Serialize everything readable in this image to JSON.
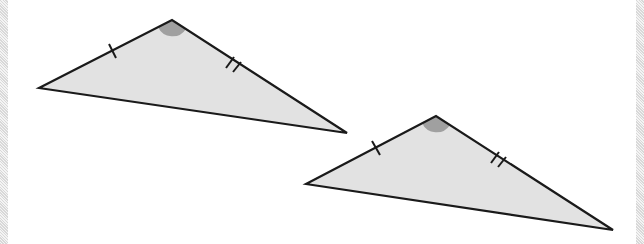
{
  "figure": {
    "colors": {
      "fill": "#e2e2e2",
      "stroke": "#1a1a1a",
      "angle_mark": "#a0a0a0"
    },
    "triangles": [
      {
        "id": "triangle-1",
        "vertices": [
          [
            39,
            88
          ],
          [
            172,
            20
          ],
          [
            347,
            133
          ]
        ],
        "angle_vertex": [
          172,
          20
        ],
        "single_tick": [
          113,
          50
        ],
        "double_tick": [
          233,
          63
        ]
      },
      {
        "id": "triangle-2",
        "vertices": [
          [
            306,
            184
          ],
          [
            436,
            116
          ],
          [
            613,
            230
          ]
        ],
        "angle_vertex": [
          436,
          116
        ],
        "single_tick": [
          376,
          148
        ],
        "double_tick": [
          498,
          158
        ]
      }
    ]
  }
}
